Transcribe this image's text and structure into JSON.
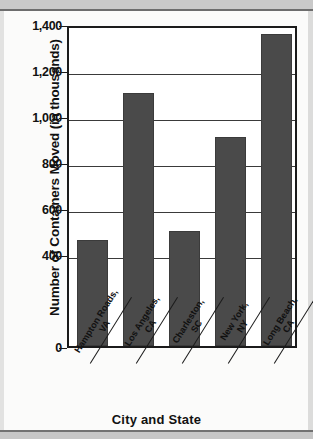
{
  "chart_data": {
    "type": "bar",
    "title": "",
    "xlabel": "City and State",
    "ylabel": "Number of Containers Moved (in thousands)",
    "categories": [
      "Hampton Roads, VA",
      "Los Angeles, CA",
      "Charleston, SC",
      "New York, NY",
      "Long Beach, CA"
    ],
    "category_lines": [
      [
        "Hampton Roads,",
        "VA"
      ],
      [
        "Los Angeles,",
        "CA"
      ],
      [
        "Charleston,",
        "SC"
      ],
      [
        "New York,",
        "NY"
      ],
      [
        "Long Beach,",
        "CA"
      ]
    ],
    "values": [
      460,
      1100,
      500,
      910,
      1355
    ],
    "ylim": [
      0,
      1400
    ],
    "yticks": [
      0,
      400,
      600,
      800,
      1000,
      1200,
      1400
    ],
    "ytick_labels": [
      "0",
      "400",
      "600",
      "800",
      "1,000",
      "1,200",
      "1,400"
    ],
    "gridlines": [
      400,
      600,
      800,
      1000,
      1200
    ],
    "grid": true,
    "legend": "none",
    "bar_color": "#4a4a4a",
    "axis_color": "#1b1b1b"
  }
}
